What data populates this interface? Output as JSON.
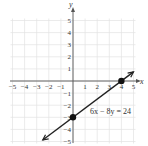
{
  "chart_data": {
    "type": "line",
    "title": "",
    "xlabel": "x",
    "ylabel": "y",
    "xlim": [
      -5,
      5
    ],
    "ylim": [
      -5,
      5
    ],
    "grid": true,
    "x_ticks": [
      "-5",
      "-4",
      "-3",
      "-2",
      "-1",
      "1",
      "2",
      "3",
      "4",
      "5"
    ],
    "y_ticks": [
      "5",
      "4",
      "3",
      "2",
      "1",
      "-1",
      "-2",
      "-3",
      "-4",
      "-5"
    ],
    "series": [
      {
        "name": "6x − 8y = 24",
        "equation": "6x − 8y = 24",
        "x": [
          -2.5,
          0,
          4,
          5
        ],
        "y": [
          -4.875,
          -3,
          0,
          0.75
        ],
        "arrows": "both"
      }
    ],
    "points": [
      {
        "x": 0,
        "y": -3,
        "label": "y-intercept"
      },
      {
        "x": 4,
        "y": 0,
        "label": "x-intercept"
      }
    ],
    "annotations": [
      {
        "text": "6x − 8y = 24",
        "x": 1.5,
        "y": -2.3
      }
    ]
  },
  "labels": {
    "x_axis": "x",
    "y_axis": "y",
    "equation": "6x − 8y = 24"
  }
}
